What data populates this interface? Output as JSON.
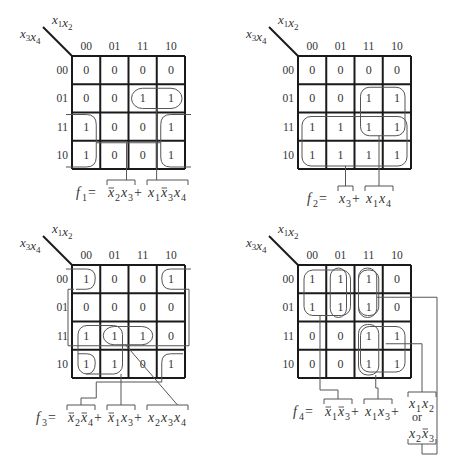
{
  "figure": {
    "column_header_labels": [
      "00",
      "01",
      "11",
      "10"
    ],
    "row_header_labels": [
      "00",
      "01",
      "11",
      "10"
    ],
    "column_variables": [
      {
        "name": "x",
        "sub": "1"
      },
      {
        "name": "x",
        "sub": "2"
      }
    ],
    "row_variables": [
      {
        "name": "x",
        "sub": "3"
      },
      {
        "name": "x",
        "sub": "4"
      }
    ]
  },
  "maps": [
    {
      "id": "f1",
      "cells": [
        [
          "0",
          "0",
          "0",
          "0"
        ],
        [
          "0",
          "0",
          "1",
          "1"
        ],
        [
          "1",
          "0",
          "0",
          "1"
        ],
        [
          "1",
          "0",
          "0",
          "1"
        ]
      ],
      "equation": [
        {
          "t": "f",
          "sub": "1"
        },
        {
          "t": " = ",
          "plain": true
        },
        {
          "t": "x",
          "sub": "2",
          "bar": true
        },
        {
          "t": "x",
          "sub": "3"
        },
        {
          "t": " + ",
          "plain": true
        },
        {
          "t": "x",
          "sub": "1"
        },
        {
          "t": "x",
          "sub": "3",
          "bar": true
        },
        {
          "t": "x",
          "sub": "4"
        }
      ]
    },
    {
      "id": "f2",
      "cells": [
        [
          "0",
          "0",
          "0",
          "0"
        ],
        [
          "0",
          "0",
          "1",
          "1"
        ],
        [
          "1",
          "1",
          "1",
          "1"
        ],
        [
          "1",
          "1",
          "1",
          "1"
        ]
      ],
      "equation": [
        {
          "t": "f",
          "sub": "2"
        },
        {
          "t": " = ",
          "plain": true
        },
        {
          "t": "x",
          "sub": "3"
        },
        {
          "t": " + ",
          "plain": true
        },
        {
          "t": "x",
          "sub": "1"
        },
        {
          "t": "x",
          "sub": "4"
        }
      ]
    },
    {
      "id": "f3",
      "cells": [
        [
          "1",
          "0",
          "0",
          "1"
        ],
        [
          "0",
          "0",
          "0",
          "0"
        ],
        [
          "1",
          "1",
          "1",
          "0"
        ],
        [
          "1",
          "1",
          "0",
          "1"
        ]
      ],
      "equation": [
        {
          "t": "f",
          "sub": "3"
        },
        {
          "t": " = ",
          "plain": true
        },
        {
          "t": "x",
          "sub": "2",
          "bar": true
        },
        {
          "t": "x",
          "sub": "4",
          "bar": true
        },
        {
          "t": " + ",
          "plain": true
        },
        {
          "t": "x",
          "sub": "1",
          "bar": true
        },
        {
          "t": "x",
          "sub": "3"
        },
        {
          "t": " + ",
          "plain": true
        },
        {
          "t": "x",
          "sub": "2"
        },
        {
          "t": "x",
          "sub": "3"
        },
        {
          "t": "x",
          "sub": "4"
        }
      ]
    },
    {
      "id": "f4",
      "cells": [
        [
          "1",
          "1",
          "1",
          "0"
        ],
        [
          "1",
          "1",
          "1",
          "0"
        ],
        [
          "0",
          "0",
          "1",
          "1"
        ],
        [
          "0",
          "0",
          "1",
          "1"
        ]
      ],
      "equation": [
        {
          "t": "f",
          "sub": "4"
        },
        {
          "t": " = ",
          "plain": true
        },
        {
          "t": "x",
          "sub": "1",
          "bar": true
        },
        {
          "t": "x",
          "sub": "3",
          "bar": true
        },
        {
          "t": " + ",
          "plain": true
        },
        {
          "t": "x",
          "sub": "1"
        },
        {
          "t": "x",
          "sub": "3"
        },
        {
          "t": " + ",
          "plain": true
        }
      ],
      "alternative": {
        "top": [
          {
            "t": "x",
            "sub": "1"
          },
          {
            "t": "x",
            "sub": "2"
          }
        ],
        "or_label": "or",
        "bottom": [
          {
            "t": "x",
            "sub": "2"
          },
          {
            "t": "x",
            "sub": "3",
            "bar": true
          }
        ]
      }
    }
  ]
}
